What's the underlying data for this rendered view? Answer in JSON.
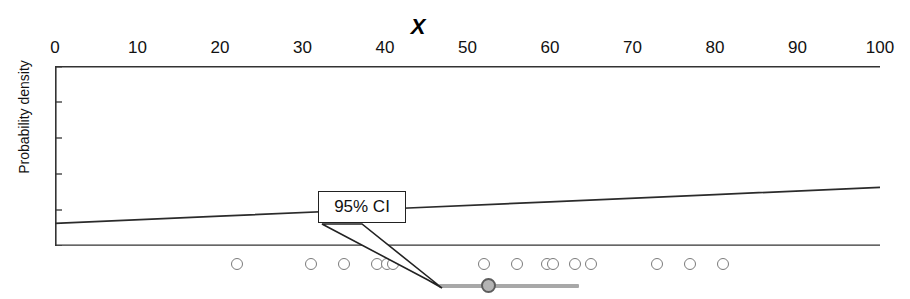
{
  "chart_data": {
    "type": "scatter",
    "title": "X",
    "xlabel": "X",
    "ylabel": "Probability density",
    "xlim": [
      0,
      100
    ],
    "xtick_major_step": 10,
    "xtick_minor_step": 2,
    "xticks": [
      0,
      10,
      20,
      30,
      40,
      50,
      60,
      70,
      80,
      90,
      100
    ],
    "xticklabels": [
      "0",
      "10",
      "20",
      "30",
      "40",
      "50",
      "60",
      "70",
      "80",
      "90",
      "100"
    ],
    "axis_position": "top",
    "grid": false,
    "legend": false,
    "yticks_labeled": false,
    "density_curve": {
      "name": "Probability density",
      "description": "Nearly flat density line just above the baseline, rising very slightly from left to right",
      "x": [
        0,
        20,
        40,
        60,
        80,
        100
      ],
      "y": [
        0.012,
        0.016,
        0.02,
        0.024,
        0.028,
        0.032
      ]
    },
    "data_points": {
      "name": "Observed values",
      "marker": "open circle",
      "count": 17,
      "values": [
        22,
        31,
        35,
        39,
        40.2,
        41,
        52,
        56,
        59.6,
        60.4,
        63,
        65,
        73,
        77,
        81
      ]
    },
    "confidence_interval": {
      "label": "95% CI",
      "level": "95%",
      "center": 52.5,
      "lower": 46.5,
      "upper": 63.5
    },
    "annotations": [
      {
        "text": "95% CI",
        "target": "confidence interval bar"
      }
    ]
  },
  "axis": {
    "title": "X",
    "y_label": "Probability density",
    "tick_labels": [
      "0",
      "10",
      "20",
      "30",
      "40",
      "50",
      "60",
      "70",
      "80",
      "90",
      "100"
    ]
  },
  "annotation": {
    "ci_label": "95% CI"
  },
  "colors": {
    "axis": "#333333",
    "curve": "#2b2b2b",
    "dot_stroke": "#7b7b7b",
    "ci_bar": "#a8a8a8",
    "ci_center_fill": "#b4b4b4",
    "ci_center_stroke": "#5d5d5d",
    "callout_border": "#222222",
    "text": "#111111"
  }
}
